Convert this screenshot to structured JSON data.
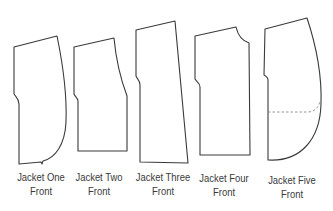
{
  "figure": {
    "pieces": [
      {
        "id": "jacket-one",
        "line1": "Jacket One",
        "line2": "Front"
      },
      {
        "id": "jacket-two",
        "line1": "Jacket Two",
        "line2": "Front"
      },
      {
        "id": "jacket-three",
        "line1": "Jacket Three",
        "line2": "Front"
      },
      {
        "id": "jacket-four",
        "line1": "Jacket Four",
        "line2": "Front"
      },
      {
        "id": "jacket-five",
        "line1": "Jacket Five",
        "line2": "Front"
      }
    ],
    "colors": {
      "outline": "#3a3a3a",
      "dashed": "#8a8a8a",
      "background": "#ffffff"
    }
  }
}
